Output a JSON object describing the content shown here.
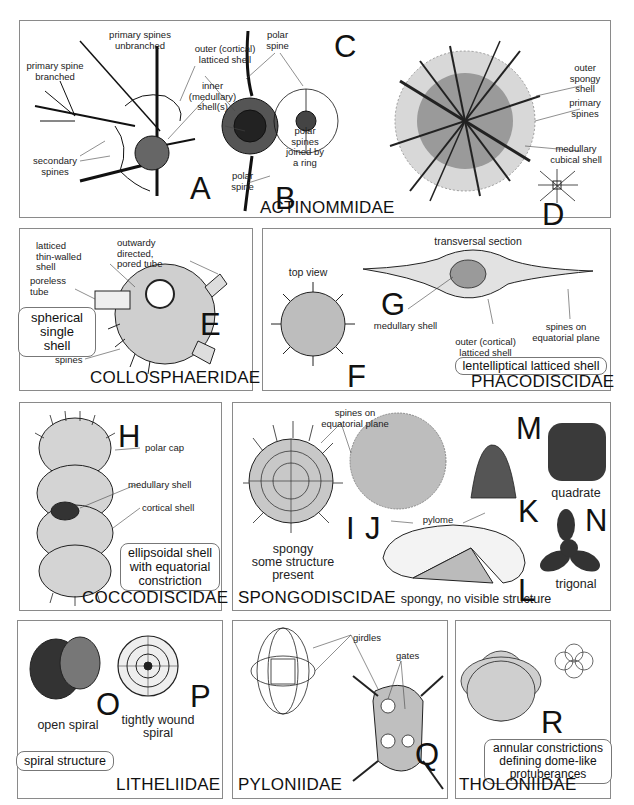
{
  "figure": {
    "panels": [
      {
        "id": "actinommidae",
        "family": "ACTINOMMIDAE",
        "letters": [
          "A",
          "B",
          "C",
          "D"
        ],
        "labels": {
          "primary_spines_unbranched": "primary spines\nunbranched",
          "primary_spine_branched": "primary spine\nbranched",
          "outer_cortical": "outer (cortical)\nlatticed shell",
          "inner_medullary": "inner\n(medullary)\nshell(s)",
          "secondary_spines": "secondary\nspines",
          "polar_spine_lower": "polar\nspine",
          "polar_spine_upper": "polar\nspine",
          "polar_spines_ring": "polar\nspines\njoined by\na ring",
          "outer_spongy": "outer\nspongy\nshell",
          "primary_spines": "primary\nspines",
          "medullary_cubical": "medullary\ncubical shell"
        }
      },
      {
        "id": "collosphaeridae",
        "family": "COLLOSPHAERIDAE",
        "letters": [
          "E"
        ],
        "note": "spherical\nsingle shell",
        "labels": {
          "latticed_thin": "latticed\nthin-walled\nshell",
          "outward_tube": "outwardy\ndirected,\npored tube",
          "poreless_tube": "poreless\ntube",
          "spines": "spines"
        }
      },
      {
        "id": "phacodiscidae",
        "family": "PHACODISCIDAE",
        "letters": [
          "F",
          "G"
        ],
        "note": "lentelliptical latticed shell",
        "labels": {
          "top_view": "top view",
          "transversal": "transversal section",
          "medullary": "medullary shell",
          "outer_cortical": "outer (cortical)\nlatticed shell",
          "spines_equatorial": "spines on\nequatorial plane"
        }
      },
      {
        "id": "coccodiscidae",
        "family": "COCCODISCIDAE",
        "letters": [
          "H"
        ],
        "note": "ellipsoidal shell\nwith equatorial\nconstriction",
        "labels": {
          "polar_cap": "polar cap",
          "medullary": "medullary shell",
          "cortical": "cortical shell"
        }
      },
      {
        "id": "spongodiscidae",
        "family": "SPONGODISCIDAE",
        "letters": [
          "I",
          "J",
          "K",
          "L",
          "M",
          "N"
        ],
        "labels": {
          "spines_equatorial": "spines on\nequatorial plane",
          "pylome": "pylome",
          "quadrate": "quadrate",
          "trigonal": "trigonal",
          "spongy_some": "spongy\nsome structure\npresent",
          "spongy_none": "spongy, no visible structure"
        }
      },
      {
        "id": "litheliidae",
        "family": "LITHELIIDAE",
        "letters": [
          "O",
          "P"
        ],
        "note": "spiral structure",
        "labels": {
          "open_spiral": "open spiral",
          "tightly_wound": "tightly wound\nspiral"
        }
      },
      {
        "id": "pyloniidae",
        "family": "PYLONIIDAE",
        "letters": [
          "Q"
        ],
        "labels": {
          "girdles": "girdles",
          "gates": "gates"
        }
      },
      {
        "id": "tholoniidae",
        "family": "THOLONIIDAE",
        "letters": [
          "R"
        ],
        "note": "annular constrictions\ndefining dome-like\nprotuberances"
      }
    ]
  }
}
